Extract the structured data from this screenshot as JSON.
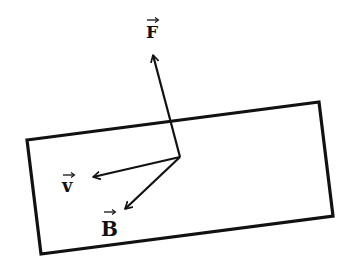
{
  "diagram": {
    "colors": {
      "stroke": "#111111",
      "background": "#ffffff"
    },
    "loop": {
      "points": "27,140 319,102 333,216 41,254"
    },
    "origin": {
      "x": 180,
      "y": 157
    },
    "vectors": [
      {
        "id": "F",
        "label": "F",
        "tip_x": 153,
        "tip_y": 55,
        "label_x": 146,
        "label_y": 38
      },
      {
        "id": "v",
        "label": "v",
        "tip_x": 93,
        "tip_y": 177,
        "label_x": 62,
        "label_y": 191
      },
      {
        "id": "B",
        "label": "B",
        "tip_x": 125,
        "tip_y": 209,
        "label_x": 102,
        "label_y": 235
      }
    ]
  }
}
